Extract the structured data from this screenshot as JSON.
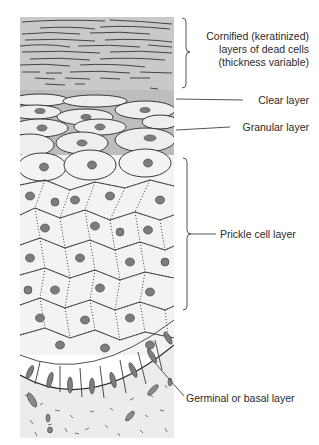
{
  "figure": {
    "colors": {
      "cornified_bg": "#c9c9c9",
      "granular_bg": "#bdbdbd",
      "cell_fill": "#f1f1f1",
      "nucleus": "#7d7d7d",
      "line": "#3a3a3a",
      "dermis_bg": "#ececec"
    }
  },
  "labels": {
    "cornified": [
      "Cornified (keratinized)",
      "layers of dead cells",
      "(thickness variable)"
    ],
    "clear": "Clear layer",
    "granular": "Granular layer",
    "prickle": "Prickle cell layer",
    "basal": "Germinal or basal layer"
  }
}
